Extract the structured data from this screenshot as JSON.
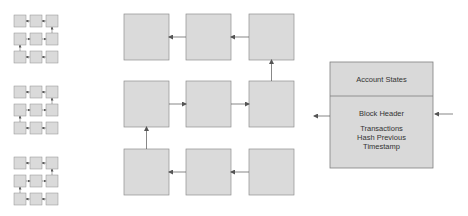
{
  "diagram": {
    "colors": {
      "cell_fill": "#dadada",
      "cell_stroke": "#8f8f8f",
      "arrow": "#555555",
      "box_fill": "#d9d9d9",
      "box_stroke": "#7f7f7f"
    },
    "mini_grids": [
      {
        "id": "mini-grid-1",
        "x": 14,
        "y": 15
      },
      {
        "id": "mini-grid-2",
        "x": 14,
        "y": 86
      },
      {
        "id": "mini-grid-3",
        "x": 14,
        "y": 157
      }
    ],
    "large_grid": {
      "cols_x": [
        124,
        186,
        249
      ],
      "rows_y": [
        14,
        81,
        149
      ],
      "cell_w": 45,
      "cell_h": 46
    },
    "block_box": {
      "top_label": "Account States",
      "header_label": "Block Header",
      "fields": [
        "Transactions",
        "Hash Previous",
        "Timestamp"
      ]
    }
  }
}
